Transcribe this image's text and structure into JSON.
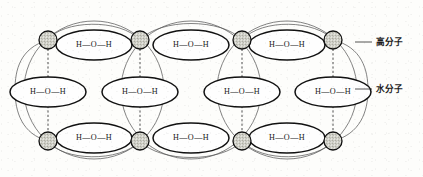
{
  "figure": {
    "type": "diagram",
    "background_color": "#fdfdfb",
    "width": 423,
    "height": 177
  },
  "labels": {
    "polymer": {
      "text": "高分子",
      "x": 382,
      "y": 42,
      "leader_from_x": 355,
      "leader_from_y": 42,
      "leader_to_x": 372,
      "leader_to_y": 42
    },
    "water": {
      "text": "水分子",
      "x": 382,
      "y": 89,
      "leader_from_x": 355,
      "leader_from_y": 89,
      "leader_to_x": 372,
      "leader_to_y": 89
    }
  },
  "molecule_label": "H—O—H",
  "colors": {
    "ink": "#111111",
    "outer_arc": "#5a5a5a",
    "hbond": "#3a3a3a",
    "fill": "#fefefe",
    "node_fill": "#d8d8d0"
  },
  "water_molecules": {
    "count": 11,
    "rx": 38,
    "ry": 15,
    "rows": [
      {
        "name": "top-row",
        "cy": 45,
        "centers_x": [
          94,
          191,
          287
        ]
      },
      {
        "name": "middle-row",
        "cy": 92,
        "centers_x": [
          48,
          140,
          242,
          333
        ]
      },
      {
        "name": "bottom-row",
        "cy": 138,
        "centers_x": [
          94,
          191,
          287
        ]
      }
    ]
  },
  "polymer_nodes": {
    "count": 8,
    "radius": 9,
    "fill": "#d8d8d0",
    "top_row_cy": 40,
    "bottom_row_cy": 141,
    "centers_x": [
      48,
      140,
      242,
      333
    ]
  },
  "hydrogen_bonds": {
    "description": "vertical dashed lines linking polymer nodes through water molecules",
    "x_positions": [
      48,
      140,
      242,
      333
    ],
    "y_start": 40,
    "y_end": 141
  },
  "outer_lobes": {
    "description": "thin large circular arcs outlining polymer chain segments",
    "centers_x": [
      94,
      191,
      287
    ],
    "cy": 90,
    "rx": 70,
    "ry": 72,
    "end_caps_x": [
      48,
      333
    ]
  }
}
